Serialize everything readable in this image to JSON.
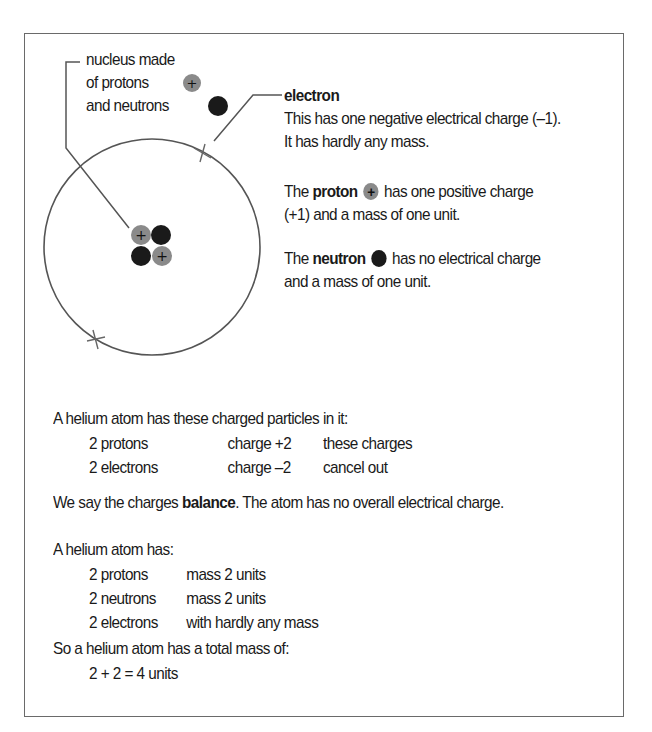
{
  "diagram": {
    "nucleus_label": [
      "nucleus made",
      "of protons",
      "and neutrons"
    ],
    "electron_heading": "electron",
    "electron_desc": [
      "This has one negative electrical charge (–1).",
      "It has hardly any mass."
    ],
    "proton_line1_pre": "The ",
    "proton_word": "proton",
    "proton_line1_post": " has one positive charge",
    "proton_line2": "(+1) and a mass of one unit.",
    "neutron_line1_pre": "The ",
    "neutron_word": "neutron",
    "neutron_line1_post": " has no electrical charge",
    "neutron_line2": "and a mass of one unit.",
    "colors": {
      "proton": "#8a8a8a",
      "neutron": "#1a1a1a",
      "line": "#555555"
    }
  },
  "charges": {
    "intro": "A helium atom has these charged particles in it:",
    "rows": [
      {
        "particle": "2 protons",
        "value": "charge +2"
      },
      {
        "particle": "2 electrons",
        "value": "charge –2"
      }
    ],
    "bracket_note": [
      "these charges",
      "cancel out"
    ],
    "balance_pre": "We say the charges ",
    "balance_word": "balance",
    "balance_post": ". The atom has no overall electrical charge."
  },
  "mass": {
    "intro": "A helium atom has:",
    "rows": [
      {
        "particle": "2 protons",
        "value": "mass 2 units"
      },
      {
        "particle": "2 neutrons",
        "value": "mass 2 units"
      },
      {
        "particle": "2 electrons",
        "value": "with hardly any mass"
      }
    ],
    "total_intro": "So a helium atom has a total mass of:",
    "total": "2 + 2 = 4 units"
  }
}
